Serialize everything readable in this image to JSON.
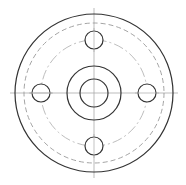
{
  "drawing": {
    "type": "flange-plan-view",
    "center": [
      94,
      93
    ],
    "colors": {
      "outline": "#333333",
      "hidden": "#9a9a9a",
      "centerline": "#aaaaaa",
      "bolt_circle": "#b5b5b5"
    },
    "outer_circle_r": 79,
    "hidden_circle_r": 70,
    "bolt_circle_r": 53,
    "hub_outer_r": 27,
    "bore_r": 14,
    "bolt_hole_r": 9,
    "bolt_holes": [
      {
        "position": "top",
        "cx": 94,
        "cy": 40
      },
      {
        "position": "right",
        "cx": 147,
        "cy": 93
      },
      {
        "position": "bottom",
        "cx": 94,
        "cy": 146
      },
      {
        "position": "left",
        "cx": 41,
        "cy": 93
      }
    ]
  }
}
